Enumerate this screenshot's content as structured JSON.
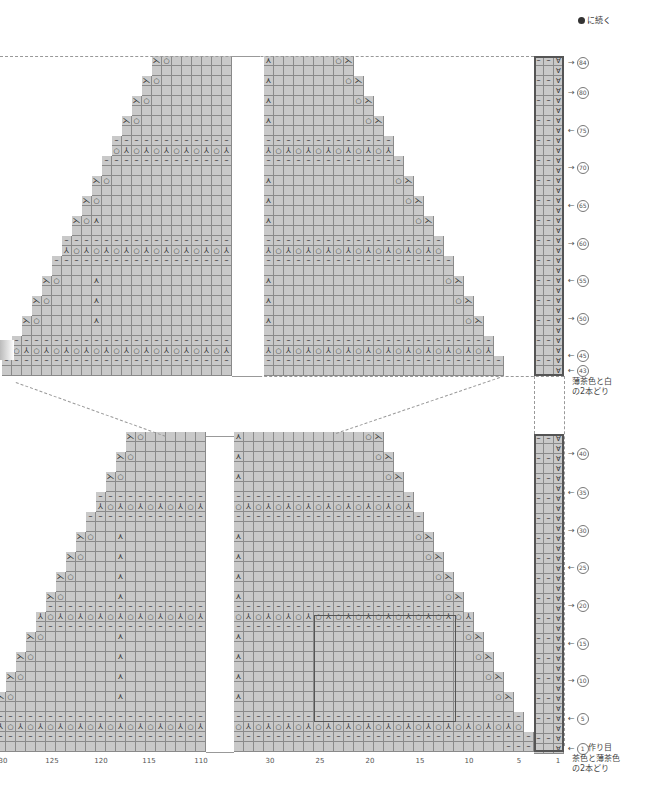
{
  "continue_note": "に続く",
  "legend_symbols": {
    "o": "yarn-over",
    "k2tog": "left-leaning decrease",
    "ssk": "right-leaning decrease",
    "cdd": "central double decrease",
    "p": "purl",
    "sl": "slip stitch"
  },
  "colors": {
    "cell_fill": "#c9c9c9",
    "grid_line": "#8a8a8a",
    "border": "#555555",
    "text": "#444444"
  },
  "yarn_notes": {
    "upper": "薄茶色と白\nの2本どり",
    "upper_line1": "薄茶色と白",
    "upper_line2": "の2本どり",
    "lower_line1": "茶色と薄茶色",
    "lower_line2": "の2本どり",
    "cast_on": "作り目"
  },
  "row_labels_upper": [
    {
      "num": "84",
      "dir": "→",
      "y": 62
    },
    {
      "num": "80",
      "dir": "→",
      "y": 92
    },
    {
      "num": "75",
      "dir": "←",
      "y": 130
    },
    {
      "num": "70",
      "dir": "→",
      "y": 167
    },
    {
      "num": "65",
      "dir": "←",
      "y": 205
    },
    {
      "num": "60",
      "dir": "→",
      "y": 243
    },
    {
      "num": "55",
      "dir": "←",
      "y": 280
    },
    {
      "num": "50",
      "dir": "→",
      "y": 318
    },
    {
      "num": "45",
      "dir": "←",
      "y": 355
    },
    {
      "num": "43",
      "dir": "←",
      "y": 370
    }
  ],
  "row_labels_lower": [
    {
      "num": "40",
      "dir": "→",
      "y": 453
    },
    {
      "num": "35",
      "dir": "←",
      "y": 492
    },
    {
      "num": "30",
      "dir": "→",
      "y": 530
    },
    {
      "num": "25",
      "dir": "←",
      "y": 567
    },
    {
      "num": "20",
      "dir": "→",
      "y": 605
    },
    {
      "num": "15",
      "dir": "←",
      "y": 643
    },
    {
      "num": "10",
      "dir": "→",
      "y": 680
    },
    {
      "num": "5",
      "dir": "←",
      "y": 718
    },
    {
      "num": "1",
      "dir": "←",
      "y": 748
    }
  ],
  "col_labels": [
    {
      "text": "30",
      "x": 3
    },
    {
      "text": "125",
      "x": 52
    },
    {
      "text": "120",
      "x": 101
    },
    {
      "text": "115",
      "x": 149
    },
    {
      "text": "110",
      "x": 201
    },
    {
      "text": "30",
      "x": 270
    },
    {
      "text": "25",
      "x": 320
    },
    {
      "text": "20",
      "x": 370
    },
    {
      "text": "15",
      "x": 420
    },
    {
      "text": "10",
      "x": 469
    },
    {
      "text": "5",
      "x": 519
    },
    {
      "text": "1",
      "x": 558
    }
  ]
}
